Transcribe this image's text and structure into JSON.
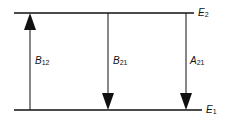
{
  "levels": {
    "upper": {
      "label": "E",
      "sub": "2"
    },
    "lower": {
      "label": "E",
      "sub": "1"
    }
  },
  "transitions": [
    {
      "label": "B",
      "sub": "12",
      "direction": "up"
    },
    {
      "label": "B",
      "sub": "21",
      "direction": "down"
    },
    {
      "label": "A",
      "sub": "21",
      "direction": "down"
    }
  ],
  "colors": {
    "line": "#111111"
  }
}
